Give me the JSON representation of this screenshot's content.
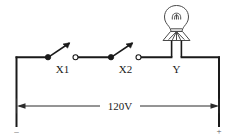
{
  "diagram": {
    "background_color": "#ffffff",
    "wire_color": "#1a1a1a",
    "labels": {
      "switch1": "X1",
      "switch2": "X2",
      "lamp": "Y",
      "voltage": "120V",
      "negative_terminal": "–",
      "positive_terminal": "+"
    },
    "components": [
      {
        "name": "switch-x1",
        "type": "switch",
        "label": "X1",
        "state": "open"
      },
      {
        "name": "switch-x2",
        "type": "switch",
        "label": "X2",
        "state": "open"
      },
      {
        "name": "lamp-y",
        "type": "lamp",
        "label": "Y"
      }
    ],
    "dimension": {
      "label": "120V",
      "arrow_left": true,
      "arrow_right": true
    }
  }
}
